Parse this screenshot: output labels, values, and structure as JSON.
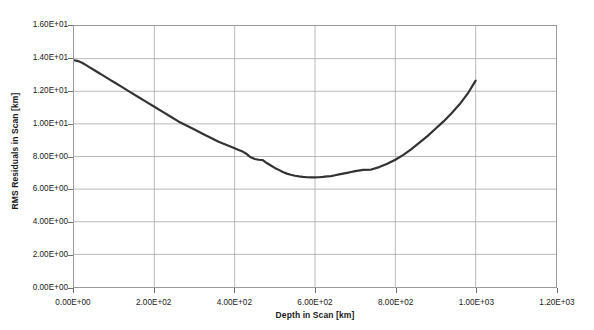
{
  "chart_data": {
    "type": "line",
    "title": "",
    "xlabel": "Depth in Scan [km]",
    "ylabel": "RMS Residuals in Scan [km]",
    "xlim": [
      0,
      1200
    ],
    "ylim": [
      0,
      16
    ],
    "xticks": [
      0,
      200,
      400,
      600,
      800,
      1000,
      1200
    ],
    "yticks": [
      0,
      2,
      4,
      6,
      8,
      10,
      12,
      14,
      16
    ],
    "xtick_labels": [
      "0.00E+00",
      "2.00E+02",
      "4.00E+02",
      "6.00E+02",
      "8.00E+02",
      "1.00E+03",
      "1.20E+03"
    ],
    "ytick_labels": [
      "0.00E+00",
      "2.00E+00",
      "4.00E+00",
      "6.00E+00",
      "8.00E+00",
      "1.00E+01",
      "1.20E+01",
      "1.40E+01",
      "1.60E+01"
    ],
    "grid": true,
    "legend": false,
    "series": [
      {
        "name": "RMS Residuals",
        "color": "#333333",
        "line_width": 2.2,
        "x": [
          0,
          10,
          20,
          30,
          40,
          50,
          60,
          70,
          80,
          90,
          100,
          120,
          140,
          160,
          180,
          200,
          220,
          240,
          260,
          280,
          300,
          320,
          340,
          360,
          380,
          400,
          410,
          420,
          430,
          440,
          450,
          460,
          470,
          480,
          490,
          500,
          510,
          520,
          530,
          540,
          550,
          560,
          570,
          580,
          590,
          600,
          610,
          620,
          630,
          640,
          650,
          660,
          670,
          680,
          690,
          700,
          720,
          740,
          760,
          780,
          800,
          820,
          840,
          860,
          880,
          900,
          920,
          940,
          960,
          980,
          1000
        ],
        "y": [
          13.9,
          13.85,
          13.75,
          13.6,
          13.45,
          13.3,
          13.15,
          13.0,
          12.85,
          12.7,
          12.55,
          12.25,
          11.95,
          11.65,
          11.35,
          11.05,
          10.75,
          10.45,
          10.15,
          9.9,
          9.65,
          9.4,
          9.15,
          8.9,
          8.7,
          8.5,
          8.4,
          8.3,
          8.15,
          7.95,
          7.85,
          7.8,
          7.78,
          7.6,
          7.45,
          7.3,
          7.18,
          7.05,
          6.95,
          6.88,
          6.82,
          6.78,
          6.75,
          6.73,
          6.72,
          6.72,
          6.73,
          6.75,
          6.78,
          6.8,
          6.85,
          6.9,
          6.95,
          7.0,
          7.05,
          7.1,
          7.18,
          7.2,
          7.35,
          7.55,
          7.8,
          8.1,
          8.45,
          8.85,
          9.25,
          9.7,
          10.15,
          10.65,
          11.2,
          11.85,
          12.65
        ]
      }
    ]
  },
  "axes": {
    "y_title": "RMS Residuals in Scan [km]",
    "x_title": "Depth in Scan [km]"
  }
}
